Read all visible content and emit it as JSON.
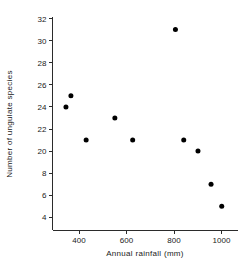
{
  "chart_data": {
    "type": "scatter",
    "title": "",
    "xlabel": "Annual rainfall (mm)",
    "ylabel": "Number of ungulate species",
    "xlim": [
      300,
      1030
    ],
    "ylim_pixels_note": "y axis tick labels as printed",
    "xticks": [
      400,
      600,
      800,
      1000
    ],
    "xtick_labels": [
      "400",
      "600",
      "800",
      "1000"
    ],
    "yticks": [
      32,
      30,
      28,
      26,
      24,
      22,
      20,
      18,
      16,
      14
    ],
    "ytick_labels": [
      "32",
      "30",
      "28",
      "26",
      "24",
      "22",
      "20",
      "8",
      "6",
      "4"
    ],
    "grid": false,
    "legend": null,
    "marker": "filled-circle",
    "marker_color": "#000000",
    "points": [
      {
        "x": 345,
        "y": 24
      },
      {
        "x": 366,
        "y": 25
      },
      {
        "x": 430,
        "y": 21
      },
      {
        "x": 551,
        "y": 23
      },
      {
        "x": 626,
        "y": 21
      },
      {
        "x": 806,
        "y": 31
      },
      {
        "x": 841,
        "y": 21
      },
      {
        "x": 901,
        "y": 20
      },
      {
        "x": 956,
        "y": 17
      },
      {
        "x": 1001,
        "y": 15
      }
    ]
  },
  "axes": {
    "x_title": "Annual rainfall (mm)",
    "y_title": "Number of ungulate species"
  }
}
